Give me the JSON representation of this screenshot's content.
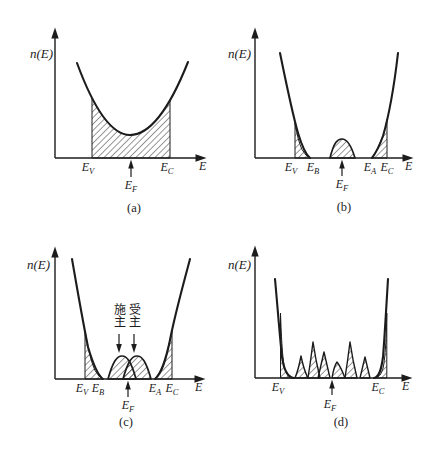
{
  "colors": {
    "ink": "#1c1c1c",
    "paper": "#ffffff"
  },
  "panels": [
    {
      "caption": "(a)",
      "y_label": "n(E)",
      "x_label": "E",
      "ticks": {
        "ev": {
          "b": "E",
          "s": "V"
        },
        "ec": {
          "b": "E",
          "s": "C"
        }
      },
      "fermi": {
        "b": "E",
        "s": "F"
      },
      "shapes": {
        "y_axis": "M55,158 L55,37",
        "y_arrow": "M55,27.5 L51.3,38.5 L58.7,38.5 Z",
        "x_axis": "M55,158 L197,158",
        "x_arrow": "M206.5,158 L195.5,154.3 L195.5,161.7 Z",
        "curve": "M77,63 Q103.5,135 130,135 Q159,135 188,62",
        "hatch": "M92,158 L92,98 Q111,135 130,135 Q150,135 170,100 L170,158 Z",
        "fermi_line": "M131,177 L131,164",
        "fermi_head": "M131,159.5 L128.2,168.5 L133.8,168.5 Z"
      }
    },
    {
      "caption": "(b)",
      "y_label": "n(E)",
      "x_label": "E",
      "ticks": {
        "ev": {
          "b": "E",
          "s": "V"
        },
        "eb": {
          "b": "E",
          "s": "B"
        },
        "ea": {
          "b": "E",
          "s": "A"
        },
        "ec": {
          "b": "E",
          "s": "C"
        }
      },
      "fermi": {
        "b": "E",
        "s": "F"
      },
      "shapes": {
        "y_axis": "M35,158 L35,37",
        "y_arrow": "M35,27.5 L31.3,38.5 L38.7,38.5 Z",
        "x_axis": "M35,158 L184,158",
        "x_arrow": "M193.5,158 L182.5,154.3 L182.5,161.7 Z",
        "curve_left": "M60,53 Q72,112 78,133 Q84,153 90,158",
        "curve_right": "M152,158 Q158,150 163,136 Q172,105 178,53",
        "hatch_left": "M75,158 L75,123 Q78,141 82,149.5 Q86,156.5 90,158 Z",
        "hump": "M110,158 C114,142 117.5,139 122,139 C126.5,139 130.5,143 135,158 Z",
        "hatch_right": "M152,158 Q158,150 163,136 Q165.8,128 167,119 L167,158 Z",
        "fermi_line": "M122,176 L122,164",
        "fermi_head": "M122,159.5 L119.2,168.5 L124.8,168.5 Z"
      }
    },
    {
      "caption": "(c)",
      "y_label": "n(E)",
      "x_label": "E",
      "ticks": {
        "ev": {
          "b": "E",
          "s": "V"
        },
        "eb": {
          "b": "E",
          "s": "B"
        },
        "ea": {
          "b": "E",
          "s": "A"
        },
        "ec": {
          "b": "E",
          "s": "C"
        }
      },
      "fermi": {
        "b": "E",
        "s": "F"
      },
      "annotations": {
        "donor": "施主",
        "acceptor": "受主"
      },
      "shapes": {
        "y_axis": "M55,152 L55,29",
        "y_arrow": "M55,19.5 L51.3,30.5 L58.7,30.5 Z",
        "x_axis": "M55,152 L196,152",
        "x_arrow": "M205.5,152 L194.5,148.3 L194.5,155.7 Z",
        "curve_left": "M72,32 Q82,90 88,120 Q96,147 103,152",
        "curve_right": "M155,152 C162,146 166,132 170,113 C175,87 184,55 190,32",
        "hatch_left": "M85,152 L85,104 Q90,133 95,143.5 Q99,150.5 103,152 Z",
        "hump_donor": "M108,152 C113,134 117,129 122,129 C127,129 131,134 136,152 Z",
        "hump_acceptor": "M123,152 C128,134 132,129 137,129 C142,129 146,134 151,152 Z",
        "hatch_right": "M155,152 C162,146 166,132 170,113 Q171.2,108 172,104 L172,152 Z",
        "fermi_line": "M128,170 L128,158",
        "fermi_head": "M128,153.5 L125.2,162.5 L130.8,162.5 Z",
        "donor_line": "M119,107 L119,119",
        "donor_head": "M119,126 L116.2,117 L121.8,117 Z",
        "acceptor_line": "M134,107 L134,119",
        "acceptor_head": "M134,126 L131.2,117 L136.8,117 Z"
      }
    },
    {
      "caption": "(d)",
      "y_label": "n(E)",
      "x_label": "E",
      "ticks": {
        "ev": {
          "b": "E",
          "s": "V"
        },
        "ec": {
          "b": "E",
          "s": "C"
        }
      },
      "fermi": {
        "b": "E",
        "s": "F"
      },
      "shapes": {
        "y_axis": "M35,151 L35,28",
        "y_arrow": "M35,18.5 L31.3,29.5 L38.7,29.5 Z",
        "x_axis": "M35,151 L183,151",
        "x_arrow": "M192.5,151 L181.5,147.3 L181.5,154.7 Z",
        "curve_left": "M55,52 C58,85 60,112 62,130 C64,144 68,150.5 74,151",
        "curve_right": "M168,52 C166,85 164.5,112 163,130 C161,145 158.5,150.5 154,151",
        "hatch_left": "M60.5,86 C61.5,114 62.5,131 64.5,140.5 C66.5,148 69.5,151 74,151 L60.5,151 Z",
        "hatch_right": "M166.8,86 C166.3,112 165.3,130 163.3,140 C161.3,148 158.5,151 154,151 L166.8,151 Z",
        "spikes": [
          "M75,151 Q78.4,143 81,129 Q83.8,143 88,151 Z",
          "M88,151 Q90.8,133 93,115 Q95.8,134 100,151 Z",
          "M98,151 Q101,138 104,125 Q107,138 110,151 Z",
          "M112,151 Q114,139 117,135 Q120.6,139.5 125,151 Z",
          "M125,151 Q127.8,133 130,115 Q132.8,134 137,151 Z",
          "M140,151 Q142.6,140 145,130 Q147.4,140 150,151 Z"
        ],
        "fermi_line": "M112,168 L112,157",
        "fermi_head": "M112,152.5 L109.2,161.5 L114.8,161.5 Z"
      }
    }
  ]
}
